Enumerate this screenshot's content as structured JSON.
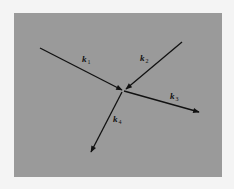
{
  "diagram": {
    "background_color": "#f4f4f4",
    "panel_color": "#9a9a9a",
    "line_color": "#111111",
    "vectors": [
      {
        "id": "k1",
        "symbol": "k",
        "subscript": "1",
        "direction": "incoming"
      },
      {
        "id": "k2",
        "symbol": "k",
        "subscript": "2",
        "direction": "incoming"
      },
      {
        "id": "k3",
        "symbol": "k",
        "subscript": "3",
        "direction": "outgoing"
      },
      {
        "id": "k4",
        "symbol": "k",
        "subscript": "4",
        "direction": "outgoing"
      }
    ]
  }
}
